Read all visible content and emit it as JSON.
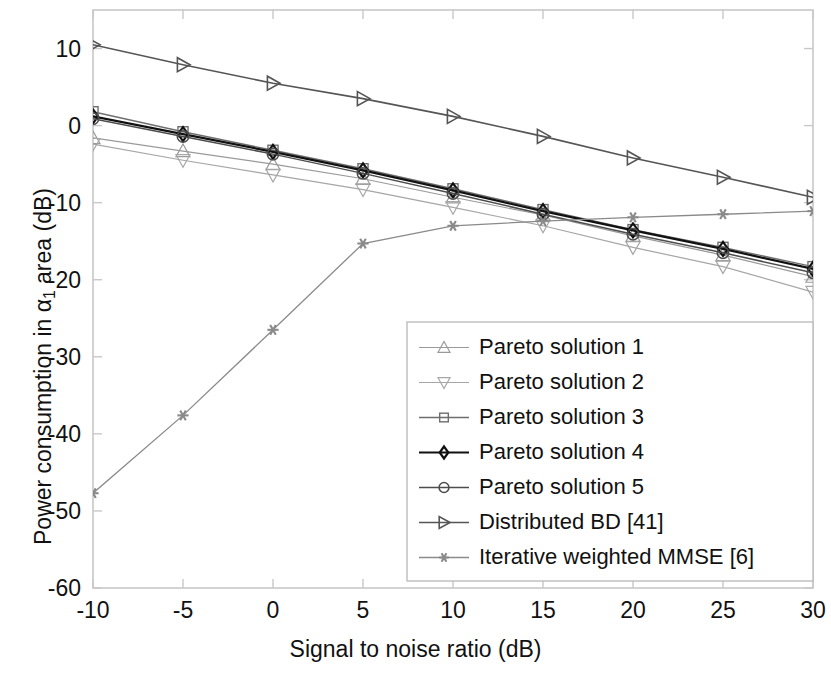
{
  "chart_data": {
    "type": "line",
    "title": "",
    "xlabel": "Signal to noise ratio (dB)",
    "ylabel_parts": {
      "pre": "Power consumption in ",
      "greek": "α",
      "sub": "1",
      "post": " area (dB)"
    },
    "ylabel": "Power consumption in α1 area (dB)",
    "x": [
      -10,
      -5,
      0,
      5,
      10,
      15,
      20,
      25,
      30
    ],
    "xlim": [
      -10,
      30
    ],
    "ylim": [
      -60,
      15
    ],
    "xticks": [
      -10,
      -5,
      0,
      5,
      10,
      15,
      20,
      25,
      30
    ],
    "xticklabels": [
      "-10",
      "-5",
      "0",
      "5",
      "10",
      "15",
      "20",
      "25",
      "30"
    ],
    "yticks": [
      10,
      0,
      -10,
      -20,
      -30,
      -40,
      -50,
      -60
    ],
    "yticklabels": [
      "10",
      "0",
      "-10",
      "-20",
      "-30",
      "-40",
      "-50",
      "-60"
    ],
    "grid": false,
    "legend_position": "lower right",
    "series": [
      {
        "name": "Pareto solution 1",
        "marker": "triangle-up",
        "color": "#9a9a9a",
        "linewidth": 1.2,
        "values": [
          -1.6,
          -3.3,
          -5.0,
          -6.9,
          -9.3,
          -11.6,
          -14.3,
          -16.8,
          -19.6
        ]
      },
      {
        "name": "Pareto solution 2",
        "marker": "triangle-down",
        "color": "#a6a6a6",
        "linewidth": 1.2,
        "values": [
          -2.4,
          -4.5,
          -6.4,
          -8.3,
          -10.6,
          -13.0,
          -15.8,
          -18.3,
          -21.6
        ]
      },
      {
        "name": "Pareto solution 3",
        "marker": "square",
        "color": "#6e6e6e",
        "linewidth": 1.4,
        "values": [
          1.8,
          -0.8,
          -3.2,
          -5.6,
          -8.2,
          -10.9,
          -13.5,
          -15.8,
          -18.3
        ]
      },
      {
        "name": "Pareto solution 4",
        "marker": "diamond",
        "color": "#111111",
        "linewidth": 2.2,
        "values": [
          1.2,
          -1.1,
          -3.4,
          -5.8,
          -8.4,
          -11.1,
          -13.6,
          -16.0,
          -18.6
        ]
      },
      {
        "name": "Pareto solution 5",
        "marker": "circle",
        "color": "#4d4d4d",
        "linewidth": 1.5,
        "values": [
          0.9,
          -1.4,
          -3.7,
          -6.2,
          -8.8,
          -11.5,
          -14.1,
          -16.5,
          -19.1
        ]
      },
      {
        "name": "Distributed BD [41]",
        "marker": "triangle-right",
        "color": "#555555",
        "linewidth": 1.6,
        "values": [
          10.5,
          7.9,
          5.5,
          3.5,
          1.2,
          -1.4,
          -4.2,
          -6.7,
          -9.3
        ]
      },
      {
        "name": "Iterative weighted MMSE [6]",
        "marker": "asterisk",
        "color": "#8a8a8a",
        "linewidth": 1.3,
        "values": [
          -47.7,
          -37.6,
          -26.5,
          -15.3,
          -13.0,
          -12.4,
          -11.9,
          -11.5,
          -11.1
        ]
      }
    ]
  },
  "legend": {
    "entries": [
      "Pareto solution 1",
      "Pareto solution 2",
      "Pareto solution 3",
      "Pareto solution 4",
      "Pareto solution 5",
      "Distributed BD [41]",
      "Iterative weighted MMSE [6]"
    ]
  },
  "colors": {
    "axis": "#c8c8c8",
    "text": "#111111",
    "background": "#ffffff",
    "legend_border": "#bdbdbd"
  }
}
